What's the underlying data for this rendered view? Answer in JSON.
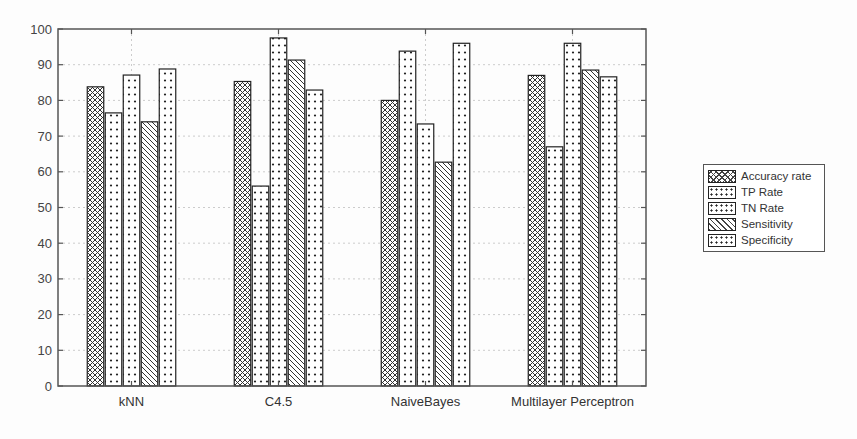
{
  "chart_data": {
    "type": "bar",
    "title": "",
    "xlabel": "",
    "ylabel": "",
    "ylim": [
      0,
      100
    ],
    "yticks": [
      0,
      10,
      20,
      30,
      40,
      50,
      60,
      70,
      80,
      90,
      100
    ],
    "grid": true,
    "legend_position": "right-outside",
    "categories": [
      "kNN",
      "C4.5",
      "NaiveBayes",
      "Multilayer Perceptron"
    ],
    "series": [
      {
        "name": "Accuracy rate",
        "pattern": "crosshatch",
        "values": [
          83.8,
          85.3,
          80.0,
          87.0
        ]
      },
      {
        "name": "TP Rate",
        "pattern": "dots",
        "values": [
          76.5,
          56.0,
          93.8,
          67.0
        ]
      },
      {
        "name": "TN Rate",
        "pattern": "dots",
        "values": [
          87.1,
          97.5,
          73.4,
          96.0
        ]
      },
      {
        "name": "Sensitivity",
        "pattern": "diagonal",
        "values": [
          74.0,
          91.3,
          62.7,
          88.5
        ]
      },
      {
        "name": "Specificity",
        "pattern": "dots",
        "values": [
          88.8,
          82.9,
          96.0,
          86.6
        ]
      }
    ]
  },
  "legend": {
    "items": [
      {
        "label": "Accuracy rate",
        "pattern": "crosshatch"
      },
      {
        "label": "TP Rate",
        "pattern": "dots"
      },
      {
        "label": "TN Rate",
        "pattern": "dots"
      },
      {
        "label": "Sensitivity",
        "pattern": "diagonal"
      },
      {
        "label": "Specificity",
        "pattern": "dots"
      }
    ]
  },
  "colors": {
    "bar_outline": "#222222",
    "pattern": "#333333",
    "axis": "#555555",
    "grid": "#cccccc",
    "background": "#fdfdfd"
  }
}
